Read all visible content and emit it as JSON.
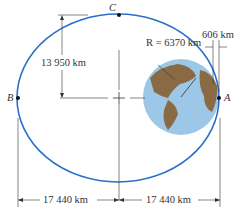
{
  "diagram": {
    "points": {
      "A": "A",
      "B": "B",
      "C": "C"
    },
    "labels": {
      "radius": "R = 6370 km",
      "altitude": "606 km",
      "semi_minor": "13 950 km",
      "left_half": "17 440 km",
      "right_half": "17 440 km"
    },
    "colors": {
      "orbit": "#2a6fc9",
      "ocean": "#9cc7e6",
      "land": "#8a6a45",
      "line": "#333333"
    }
  }
}
